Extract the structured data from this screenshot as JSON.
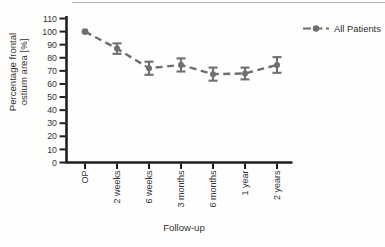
{
  "chart_data": {
    "type": "line",
    "title": "",
    "categories": [
      "OP",
      "2 weeks",
      "6 weeks",
      "3 months",
      "6 months",
      "1 year",
      "2 years"
    ],
    "series": [
      {
        "name": "All Patients",
        "color": "#6f6f6f",
        "line_style": "dashed",
        "marker": "circle",
        "values": [
          100,
          87,
          72,
          74.5,
          67.5,
          68,
          74.5
        ],
        "errors": [
          0,
          4,
          5,
          5,
          5,
          4.5,
          6
        ]
      }
    ],
    "xlabel": "Follow-up",
    "ylabel": "Percentage frontal ostium area [%]",
    "ylim": [
      0,
      110
    ],
    "ytick_step": 10,
    "yticks": [
      0,
      10,
      20,
      30,
      40,
      50,
      60,
      70,
      80,
      90,
      100,
      110
    ],
    "grid": false,
    "legend_position": "right",
    "axis_color": "#1e1e1e",
    "tick_text_color": "#333333"
  }
}
